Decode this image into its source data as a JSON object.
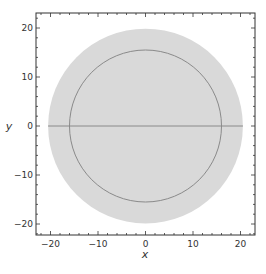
{
  "chart_data": {
    "type": "scatter",
    "title": "",
    "xlabel": "x",
    "ylabel": "y",
    "xlim": [
      -23,
      23
    ],
    "ylim": [
      -23,
      23
    ],
    "grid": false,
    "legend": null,
    "x_ticks": [
      -20,
      -10,
      0,
      10,
      20
    ],
    "y_ticks": [
      20,
      10,
      0,
      -10,
      -20
    ],
    "x_tick_labels": [
      "−20",
      "−10",
      "0",
      "10",
      "20"
    ],
    "y_tick_labels": [
      "20",
      "10",
      "0",
      "−10",
      "−20"
    ],
    "shapes": [
      {
        "kind": "filled-disk",
        "center": [
          0,
          0
        ],
        "radius": 20.5,
        "fill": "#d9d9d9"
      },
      {
        "kind": "circle-outline",
        "center": [
          0,
          0
        ],
        "radius": 16,
        "stroke": "#8a8a8a"
      },
      {
        "kind": "line-segment",
        "from": [
          -20.5,
          0
        ],
        "to": [
          20.5,
          0
        ],
        "stroke": "#8a8a8a"
      }
    ]
  },
  "colors": {
    "disk_fill": "#d9d9d9",
    "line_stroke": "#8a8a8a",
    "axis": "#333333",
    "background": "#ffffff"
  }
}
